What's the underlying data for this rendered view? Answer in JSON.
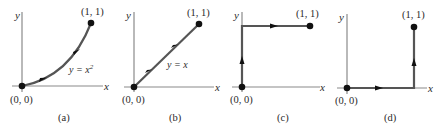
{
  "panels": [
    {
      "id": "a",
      "caption": "(a)",
      "y_axis_label": "y",
      "x_axis_label": "x",
      "start_label": "(0, 0)",
      "end_label": "(1, 1)",
      "curve_label": "y = x",
      "curve_label_sup": "2",
      "path_type": "parabola y = x^2"
    },
    {
      "id": "b",
      "caption": "(b)",
      "y_axis_label": "y",
      "x_axis_label": "x",
      "start_label": "(0, 0)",
      "end_label": "(1, 1)",
      "curve_label": "y = x",
      "path_type": "line y = x"
    },
    {
      "id": "c",
      "caption": "(c)",
      "y_axis_label": "y",
      "x_axis_label": "x",
      "start_label": "(0, 0)",
      "end_label": "(1, 1)",
      "path_type": "up y-axis then right to (1,1)"
    },
    {
      "id": "d",
      "caption": "(d)",
      "y_axis_label": "y",
      "x_axis_label": "x",
      "start_label": "(0, 0)",
      "end_label": "(1, 1)",
      "path_type": "right along x-axis then up to (1,1)"
    }
  ],
  "colors": {
    "axis": "#8a8a8a",
    "path": "#555555",
    "point": "#111111"
  }
}
